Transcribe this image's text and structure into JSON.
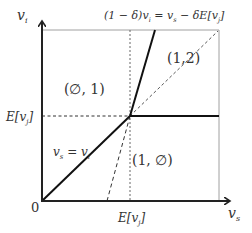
{
  "diagram": {
    "axes": {
      "y_label": "v",
      "y_label_sub": "i",
      "x_label": "v",
      "x_label_sub": "s",
      "origin_label": "0"
    },
    "ticks": {
      "x_tick": "E[v",
      "x_tick_sub": "j",
      "x_tick_close": "]",
      "y_tick": "E[v",
      "y_tick_sub": "j",
      "y_tick_close": "]"
    },
    "equations": {
      "top": "(1 − δ)v",
      "top_sub1": "i",
      "top_mid": " = v",
      "top_sub2": "s",
      "top_end": " − δE[v",
      "top_sub3": "j",
      "top_close": "]",
      "diag": "v",
      "diag_sub1": "s",
      "diag_mid": " = v",
      "diag_sub2": "i"
    },
    "regions": [
      {
        "id": "upper-left",
        "label": "(∅, 1)"
      },
      {
        "id": "upper-right",
        "label": "(1,2)"
      },
      {
        "id": "lower-right",
        "label": "(1, ∅)"
      }
    ],
    "colors": {
      "axis": "#222222",
      "frame": "#999999",
      "text": "#333333"
    }
  }
}
